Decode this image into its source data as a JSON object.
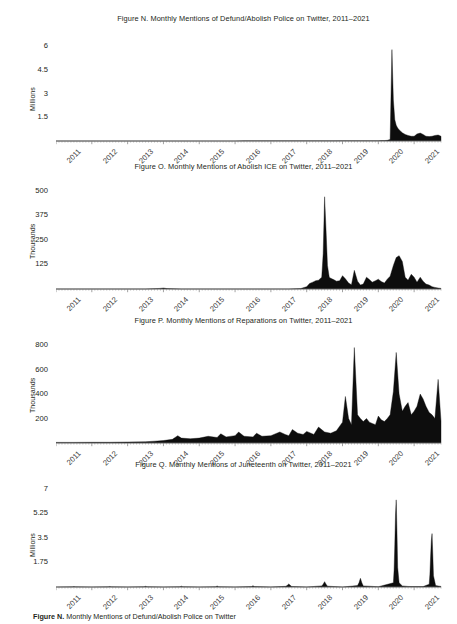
{
  "page": {
    "width": 457,
    "height": 624,
    "background": "#ffffff",
    "ink": "#231f20",
    "axis_color": "#6e6e6e",
    "bottom_caption": "Figure N. Monthly Mentions of Defund/Abolish Police on Twitter",
    "bottom_caption_lead": "Figure N.",
    "bottom_caption_rest": " Monthly Mentions of Defund/Abolish Police on Twitter"
  },
  "chart_data": [
    {
      "id": "figure-n",
      "type": "area",
      "title": "Figure N. Monthly Mentions of Defund/Abolish Police on Twitter, 2011–2021",
      "xlabel": "",
      "ylabel": "Millions",
      "ylim": [
        0,
        6.6
      ],
      "yticks": [
        1.5,
        3,
        4.5,
        6
      ],
      "ytick_labels": [
        "1.5",
        "3",
        "4.5",
        "6"
      ],
      "grid": false,
      "legend": "none",
      "xlim": [
        2011.0,
        2021.75
      ],
      "categories": [
        "2011",
        "2012",
        "2013",
        "2014",
        "2015",
        "2016",
        "2017",
        "2018",
        "2019",
        "2020",
        "2021"
      ],
      "x": [
        2011.0,
        2011.25,
        2011.5,
        2011.75,
        2012.0,
        2012.25,
        2012.5,
        2012.75,
        2013.0,
        2013.25,
        2013.5,
        2013.75,
        2014.0,
        2014.25,
        2014.5,
        2014.75,
        2015.0,
        2015.25,
        2015.5,
        2015.75,
        2016.0,
        2016.25,
        2016.5,
        2016.75,
        2017.0,
        2017.25,
        2017.5,
        2017.75,
        2018.0,
        2018.25,
        2018.5,
        2018.75,
        2019.0,
        2019.25,
        2019.5,
        2019.75,
        2020.0,
        2020.08,
        2020.17,
        2020.25,
        2020.33,
        2020.38,
        2020.42,
        2020.46,
        2020.5,
        2020.54,
        2020.58,
        2020.63,
        2020.67,
        2020.75,
        2020.83,
        2020.92,
        2021.0,
        2021.08,
        2021.17,
        2021.25,
        2021.33,
        2021.42,
        2021.5,
        2021.58,
        2021.67,
        2021.75
      ],
      "values": [
        0,
        0,
        0,
        0,
        0,
        0,
        0,
        0,
        0,
        0,
        0,
        0,
        0,
        0,
        0,
        0,
        0,
        0,
        0,
        0,
        0,
        0.01,
        0.01,
        0.01,
        0.01,
        0.01,
        0.01,
        0.01,
        0.01,
        0.01,
        0.01,
        0.01,
        0.02,
        0.02,
        0.02,
        0.02,
        0.02,
        0.03,
        0.03,
        0.04,
        0.1,
        5.8,
        2.6,
        1.35,
        1.0,
        0.82,
        0.72,
        0.6,
        0.52,
        0.42,
        0.35,
        0.3,
        0.3,
        0.45,
        0.5,
        0.42,
        0.3,
        0.28,
        0.3,
        0.35,
        0.38,
        0.3
      ],
      "peak": {
        "x": 2020.38,
        "y": 5.8,
        "label": "mid-2020 spike"
      }
    },
    {
      "id": "figure-o",
      "type": "area",
      "title": "Figure O. Monthly Mentions of Abolish ICE on Twitter, 2011–2021",
      "xlabel": "",
      "ylabel": "Thousands",
      "ylim": [
        0,
        530
      ],
      "yticks": [
        125,
        250,
        375,
        500
      ],
      "ytick_labels": [
        "125",
        "250",
        "375",
        "500"
      ],
      "grid": false,
      "legend": "none",
      "xlim": [
        2011.0,
        2021.75
      ],
      "categories": [
        "2011",
        "2012",
        "2013",
        "2014",
        "2015",
        "2016",
        "2017",
        "2018",
        "2019",
        "2020",
        "2021"
      ],
      "x": [
        2011.0,
        2011.5,
        2012.0,
        2012.5,
        2013.0,
        2013.5,
        2013.9,
        2014.0,
        2014.1,
        2014.5,
        2015.0,
        2015.5,
        2016.0,
        2016.5,
        2017.0,
        2017.5,
        2017.83,
        2018.0,
        2018.08,
        2018.17,
        2018.25,
        2018.33,
        2018.42,
        2018.46,
        2018.5,
        2018.54,
        2018.58,
        2018.63,
        2018.67,
        2018.75,
        2018.83,
        2018.92,
        2019.0,
        2019.08,
        2019.17,
        2019.25,
        2019.33,
        2019.42,
        2019.5,
        2019.58,
        2019.67,
        2019.75,
        2019.83,
        2019.92,
        2020.0,
        2020.08,
        2020.17,
        2020.25,
        2020.33,
        2020.42,
        2020.5,
        2020.58,
        2020.67,
        2020.75,
        2020.83,
        2020.92,
        2021.0,
        2021.08,
        2021.17,
        2021.25,
        2021.33,
        2021.42,
        2021.5,
        2021.58,
        2021.67,
        2021.75
      ],
      "values": [
        0,
        0,
        0,
        0,
        0,
        0,
        3,
        5,
        2,
        0,
        0,
        0,
        0,
        0,
        0,
        0,
        2,
        12,
        28,
        35,
        42,
        45,
        60,
        180,
        470,
        300,
        120,
        60,
        55,
        48,
        40,
        42,
        68,
        52,
        30,
        22,
        95,
        40,
        20,
        25,
        60,
        48,
        35,
        42,
        50,
        38,
        30,
        50,
        65,
        120,
        160,
        170,
        140,
        60,
        45,
        75,
        60,
        35,
        60,
        40,
        25,
        20,
        12,
        8,
        5,
        3
      ],
      "peak": {
        "x": 2018.5,
        "y": 470,
        "label": "mid-2018 spike"
      }
    },
    {
      "id": "figure-p",
      "type": "area",
      "title": "Figure P. Monthly Mentions of Reparations on Twitter, 2011–2021",
      "xlabel": "",
      "ylabel": "Thousands",
      "ylim": [
        0,
        850
      ],
      "yticks": [
        200,
        400,
        600,
        800
      ],
      "ytick_labels": [
        "200",
        "400",
        "600",
        "800"
      ],
      "grid": false,
      "legend": "none",
      "xlim": [
        2011.0,
        2021.75
      ],
      "categories": [
        "2011",
        "2012",
        "2013",
        "2014",
        "2015",
        "2016",
        "2017",
        "2018",
        "2019",
        "2020",
        "2021"
      ],
      "x": [
        2011.0,
        2011.5,
        2012.0,
        2012.5,
        2013.0,
        2013.5,
        2013.75,
        2014.0,
        2014.25,
        2014.4,
        2014.5,
        2014.75,
        2015.0,
        2015.25,
        2015.5,
        2015.6,
        2015.75,
        2016.0,
        2016.1,
        2016.25,
        2016.5,
        2016.6,
        2016.75,
        2017.0,
        2017.25,
        2017.4,
        2017.5,
        2017.6,
        2017.75,
        2017.9,
        2018.0,
        2018.2,
        2018.33,
        2018.5,
        2018.67,
        2018.83,
        2019.0,
        2019.08,
        2019.17,
        2019.25,
        2019.33,
        2019.42,
        2019.5,
        2019.58,
        2019.67,
        2019.75,
        2019.83,
        2019.92,
        2020.0,
        2020.08,
        2020.17,
        2020.25,
        2020.33,
        2020.42,
        2020.5,
        2020.58,
        2020.67,
        2020.75,
        2020.83,
        2020.92,
        2021.0,
        2021.08,
        2021.17,
        2021.25,
        2021.33,
        2021.42,
        2021.5,
        2021.58,
        2021.67,
        2021.75
      ],
      "values": [
        5,
        5,
        6,
        6,
        8,
        10,
        15,
        20,
        30,
        60,
        40,
        35,
        40,
        55,
        45,
        75,
        50,
        60,
        90,
        55,
        50,
        80,
        55,
        60,
        90,
        70,
        60,
        110,
        80,
        70,
        95,
        70,
        130,
        90,
        80,
        100,
        170,
        380,
        200,
        150,
        780,
        230,
        200,
        175,
        200,
        170,
        160,
        150,
        220,
        190,
        175,
        200,
        230,
        420,
        740,
        400,
        260,
        300,
        330,
        230,
        260,
        300,
        400,
        360,
        300,
        250,
        230,
        200,
        520,
        180
      ],
      "peak": {
        "x": 2019.33,
        "y": 780,
        "label": "2019 spike"
      }
    },
    {
      "id": "figure-q",
      "type": "area",
      "title": "Figure Q. Monthly Mentions of Juneteenth on Twitter, 2011–2021",
      "xlabel": "",
      "ylabel": "Millions",
      "ylim": [
        0,
        7.4
      ],
      "yticks": [
        1.75,
        3.5,
        5.25,
        7
      ],
      "ytick_labels": [
        "1.75",
        "3.5",
        "5.25",
        "7"
      ],
      "grid": false,
      "legend": "none",
      "xlim": [
        2011.0,
        2021.75
      ],
      "categories": [
        "2011",
        "2012",
        "2013",
        "2014",
        "2015",
        "2016",
        "2017",
        "2018",
        "2019",
        "2020",
        "2021"
      ],
      "x": [
        2011.0,
        2011.46,
        2011.5,
        2011.54,
        2012.0,
        2012.46,
        2012.5,
        2012.54,
        2013.0,
        2013.46,
        2013.5,
        2013.54,
        2014.0,
        2014.46,
        2014.5,
        2014.54,
        2015.0,
        2015.46,
        2015.5,
        2015.54,
        2016.0,
        2016.46,
        2016.5,
        2016.54,
        2017.0,
        2017.42,
        2017.46,
        2017.5,
        2017.54,
        2017.58,
        2018.0,
        2018.42,
        2018.46,
        2018.5,
        2018.54,
        2018.58,
        2019.0,
        2019.42,
        2019.46,
        2019.5,
        2019.54,
        2019.58,
        2020.0,
        2020.42,
        2020.44,
        2020.46,
        2020.48,
        2020.5,
        2020.52,
        2020.54,
        2020.58,
        2020.67,
        2020.83,
        2021.0,
        2021.25,
        2021.42,
        2021.44,
        2021.46,
        2021.48,
        2021.5,
        2021.52,
        2021.54,
        2021.6,
        2021.75
      ],
      "values": [
        0,
        0.01,
        0.03,
        0.01,
        0,
        0.01,
        0.04,
        0.01,
        0,
        0.02,
        0.05,
        0.02,
        0,
        0.02,
        0.06,
        0.02,
        0,
        0.02,
        0.07,
        0.02,
        0,
        0.03,
        0.09,
        0.03,
        0,
        0.05,
        0.12,
        0.22,
        0.12,
        0.04,
        0,
        0.08,
        0.2,
        0.38,
        0.2,
        0.06,
        0,
        0.1,
        0.3,
        0.62,
        0.3,
        0.08,
        0.02,
        0.3,
        1.2,
        3.0,
        5.2,
        6.2,
        4.0,
        1.4,
        0.3,
        0.08,
        0.04,
        0.03,
        0.03,
        0.2,
        0.9,
        2.2,
        3.3,
        3.8,
        2.4,
        0.8,
        0.1,
        0.04
      ],
      "peak": {
        "x": 2020.5,
        "y": 6.2,
        "label": "June 2020 spike"
      }
    }
  ]
}
